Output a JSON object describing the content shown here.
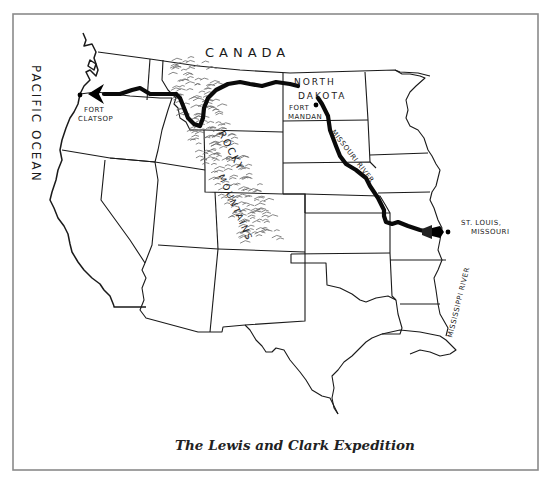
{
  "map": {
    "title": "The Lewis and Clark Expedition",
    "labels": {
      "canada": "CANADA",
      "pacific_ocean": "PACIFIC OCEAN",
      "north_dakota_line1": "NORTH",
      "north_dakota_line2": "DAKOTA",
      "fort_mandan_line1": "FORT",
      "fort_mandan_line2": "MANDAN",
      "fort_clatsop_line1": "FORT",
      "fort_clatsop_line2": "CLATSOP",
      "st_louis_line1": "ST. LOUIS,",
      "st_louis_line2": "MISSOURI",
      "missouri_river": "MISSOURI RIVER",
      "mississippi_river": "MISSISSIPPI RIVER",
      "rocky": "ROCKY",
      "mountains": "MOUNTAINS"
    },
    "places": [
      {
        "name": "Fort Clatsop",
        "role": "western endpoint"
      },
      {
        "name": "Fort Mandan",
        "role": "winter camp"
      },
      {
        "name": "St. Louis, Missouri",
        "role": "starting point"
      }
    ],
    "route_description": "St. Louis up the Missouri River to Fort Mandan, west across the Rocky Mountains to Fort Clatsop",
    "colors": {
      "ink": "#1a1a1a",
      "route": "#0a0a0a",
      "frame": "#8a8a8a",
      "background": "#ffffff"
    }
  }
}
